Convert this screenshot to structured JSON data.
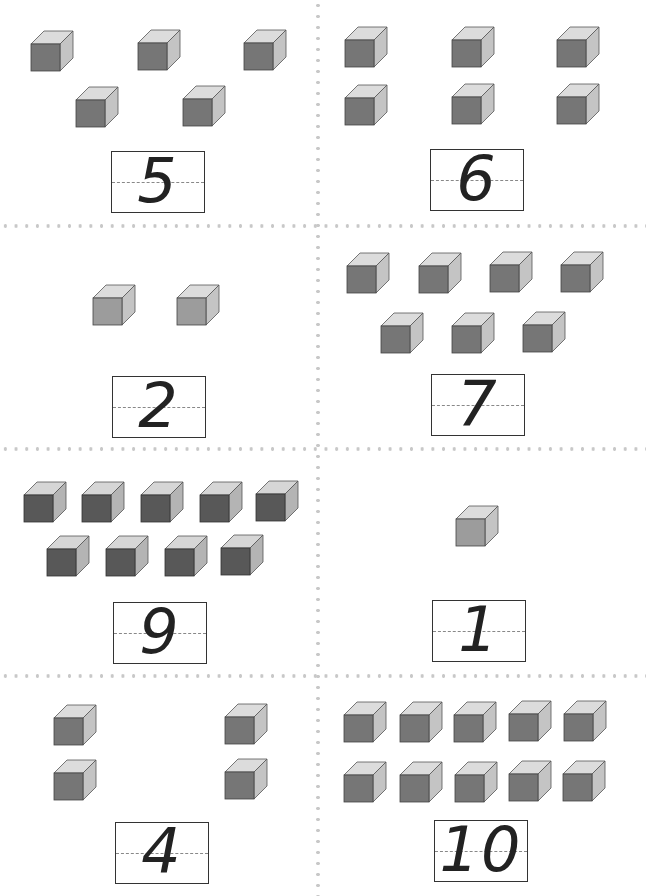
{
  "worksheet": {
    "cells": [
      {
        "id": "cell-5",
        "number": "5",
        "cube_count": 5,
        "cube_shade": "medium"
      },
      {
        "id": "cell-6",
        "number": "6",
        "cube_count": 6,
        "cube_shade": "medium"
      },
      {
        "id": "cell-2",
        "number": "2",
        "cube_count": 2,
        "cube_shade": "light"
      },
      {
        "id": "cell-7",
        "number": "7",
        "cube_count": 7,
        "cube_shade": "medium"
      },
      {
        "id": "cell-9",
        "number": "9",
        "cube_count": 9,
        "cube_shade": "dark"
      },
      {
        "id": "cell-1",
        "number": "1",
        "cube_count": 1,
        "cube_shade": "light"
      },
      {
        "id": "cell-4",
        "number": "4",
        "cube_count": 4,
        "cube_shade": "medium"
      },
      {
        "id": "cell-10",
        "number": "10",
        "cube_count": 10,
        "cube_shade": "medium"
      }
    ]
  },
  "colors": {
    "cube_light_front": "#9c9c9c",
    "cube_medium_front": "#767676",
    "cube_dark_front": "#585858",
    "cube_top": "#dcdcdc",
    "cube_side": "#c4c4c4",
    "dots": "#c8c8c8"
  }
}
